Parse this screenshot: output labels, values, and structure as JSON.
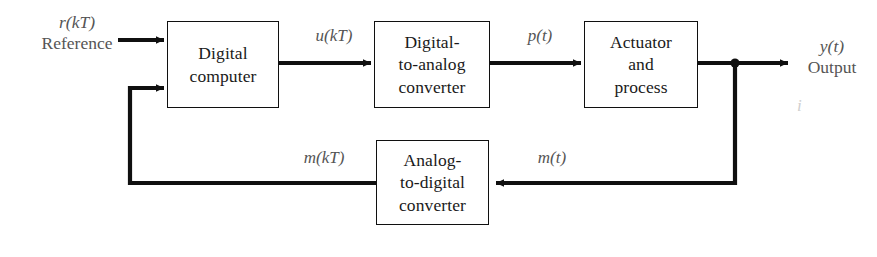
{
  "diagram": {
    "canvas": {
      "width": 877,
      "height": 257,
      "background": "#ffffff"
    },
    "colors": {
      "line": "#101010",
      "block_border": "#101010",
      "block_text": "#1a1a1a",
      "signal_label": "#555555",
      "ghost": "#cfcfcf"
    },
    "blocks": [
      {
        "id": "digital-computer",
        "line1": "Digital",
        "line2": "computer",
        "line3": "",
        "x": 167,
        "y": 21,
        "w": 112,
        "h": 87
      },
      {
        "id": "dac",
        "line1": "Digital-",
        "line2": "to-analog",
        "line3": "converter",
        "x": 374,
        "y": 21,
        "w": 116,
        "h": 87
      },
      {
        "id": "actuator-process",
        "line1": "Actuator",
        "line2": "and",
        "line3": "process",
        "x": 584,
        "y": 21,
        "w": 114,
        "h": 87
      },
      {
        "id": "adc",
        "line1": "Analog-",
        "line2": "to-digital",
        "line3": "converter",
        "x": 376,
        "y": 140,
        "w": 113,
        "h": 85
      }
    ],
    "signals": [
      {
        "id": "reference",
        "var": "r(kT)",
        "sub": "Reference",
        "x": 18,
        "y": 12,
        "w": 118
      },
      {
        "id": "u-kt",
        "var": "u(kT)",
        "sub": "",
        "x": 292,
        "y": 26,
        "w": 84
      },
      {
        "id": "p-t",
        "var": "p(t)",
        "sub": "",
        "x": 498,
        "y": 26,
        "w": 84
      },
      {
        "id": "y-t",
        "var": "y(t)",
        "sub": "Output",
        "x": 792,
        "y": 36,
        "w": 80
      },
      {
        "id": "m-t",
        "var": "m(t)",
        "sub": "",
        "x": 512,
        "y": 148,
        "w": 80
      },
      {
        "id": "m-kt",
        "var": "m(kT)",
        "sub": "",
        "x": 278,
        "y": 148,
        "w": 92
      }
    ],
    "ghost_marks": [
      {
        "id": "ghost-i",
        "text": "i",
        "x": 797,
        "y": 96,
        "size": 17
      }
    ],
    "junction": {
      "id": "output-takeoff-junction",
      "x": 735,
      "y": 63,
      "r": 4.6
    },
    "wires": [
      {
        "id": "reference-input-wire",
        "from": "reference-label",
        "to": "digital-computer",
        "arrow": true
      },
      {
        "id": "computer-to-dac-wire",
        "from": "digital-computer",
        "to": "dac",
        "arrow": true
      },
      {
        "id": "dac-to-actuator-wire",
        "from": "dac",
        "to": "actuator-process",
        "arrow": true
      },
      {
        "id": "actuator-to-output-wire",
        "from": "actuator-process",
        "to": "output",
        "arrow": true
      },
      {
        "id": "output-to-adc-feedback-wire",
        "from": "output-takeoff-junction",
        "to": "adc",
        "arrow": true
      },
      {
        "id": "adc-to-computer-feedback-wire",
        "from": "adc",
        "to": "digital-computer",
        "arrow": true
      }
    ]
  }
}
